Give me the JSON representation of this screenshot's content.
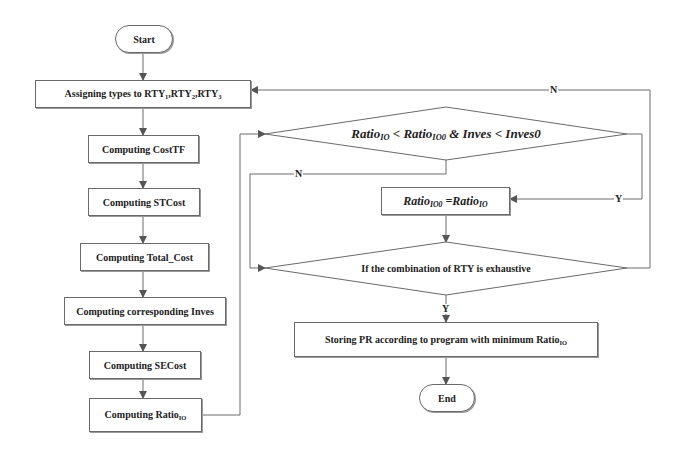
{
  "flowchart": {
    "start": "Start",
    "end": "End",
    "left_column": [
      {
        "id": "assign",
        "text": "Assigning types to RTY",
        "subs": [
          "1",
          "2",
          "3"
        ]
      },
      {
        "id": "costtf",
        "text": "Computing CostTF"
      },
      {
        "id": "stcost",
        "text": "Computing STCost"
      },
      {
        "id": "totalcost",
        "text": "Computing Total_Cost"
      },
      {
        "id": "inves",
        "text": "Computing corresponding Inves"
      },
      {
        "id": "secost",
        "text": "Computing SECost"
      },
      {
        "id": "ratio",
        "text": "Computing Ratio",
        "sub": "IO"
      }
    ],
    "decision1": {
      "parts": [
        "Ratio",
        "IO",
        " < Ratio",
        "IO0",
        " & Inves < Inves0"
      ],
      "yes_label": "Y",
      "no_label": "N"
    },
    "update_box": {
      "parts": [
        "Ratio",
        "IO0",
        " =Ratio",
        "IO"
      ]
    },
    "decision2": {
      "text": "If the combination of RTY is exhaustive",
      "yes_label": "Y",
      "no_label": "N"
    },
    "store_box": {
      "text": "Storing PR according to program with minimum Ratio",
      "sub": "IO"
    }
  },
  "colors": {
    "line": "#6a6a6a",
    "background": "#ffffff",
    "text": "#222222"
  }
}
